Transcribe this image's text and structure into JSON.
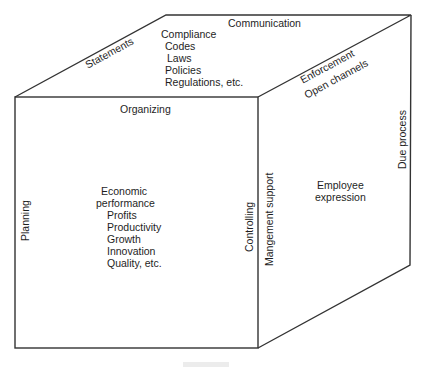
{
  "diagram": {
    "type": "cube",
    "line_color": "#333333",
    "front_face": {
      "top_label": "Organizing",
      "left_label": "Planning",
      "right_label": "Controlling",
      "center": {
        "heading_line1": "Economic",
        "heading_line2": "performance",
        "items": [
          "Profits",
          "Productivity",
          "Growth",
          "Innovation",
          "Quality, etc."
        ]
      }
    },
    "top_face": {
      "back_label": "Communication",
      "left_edge_label": "Statements",
      "right_edge_label_upper": "Enforcement",
      "center": {
        "heading": "Compliance",
        "items": [
          "Codes",
          "Laws",
          "Policies",
          "Regulations, etc."
        ]
      }
    },
    "side_face": {
      "top_edge_label": "Open channels",
      "left_label": "Mangement support",
      "right_label": "Due process",
      "center": {
        "line1": "Employee",
        "line2": "expression"
      }
    }
  }
}
